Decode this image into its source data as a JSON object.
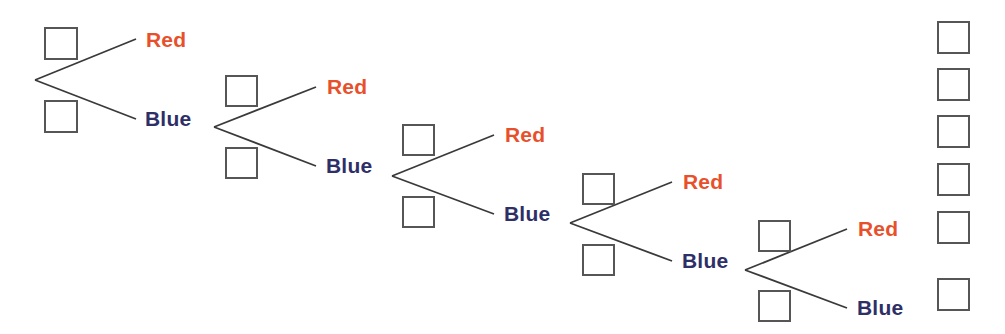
{
  "diagram": {
    "colors": {
      "red_label": "#e8502c",
      "blue_label": "#2f2f68",
      "line": "#3a3a3a",
      "box_border": "#565656",
      "background": "#ffffff"
    },
    "stages": [
      {
        "index": 1,
        "vertex": {
          "x": 35,
          "y": 80
        },
        "boxes": [
          {
            "name": "stage-1-upper-probability-box",
            "x": 44,
            "y": 27,
            "w": 34,
            "h": 33,
            "value": ""
          },
          {
            "name": "stage-1-lower-probability-box",
            "x": 44,
            "y": 100,
            "w": 34,
            "h": 33,
            "value": ""
          }
        ],
        "branches": [
          {
            "outcome": "Red",
            "label": "Red",
            "color": "red",
            "end": {
              "x": 136,
              "y": 39
            },
            "label_x": 146,
            "label_y": 29
          },
          {
            "outcome": "Blue",
            "label": "Blue",
            "color": "blue",
            "end": {
              "x": 136,
              "y": 119
            },
            "label_x": 145,
            "label_y": 108
          }
        ]
      },
      {
        "index": 2,
        "vertex": {
          "x": 214,
          "y": 127
        },
        "boxes": [
          {
            "name": "stage-2-upper-probability-box",
            "x": 225,
            "y": 75,
            "w": 33,
            "h": 32,
            "value": ""
          },
          {
            "name": "stage-2-lower-probability-box",
            "x": 225,
            "y": 147,
            "w": 33,
            "h": 32,
            "value": ""
          }
        ],
        "branches": [
          {
            "outcome": "Red",
            "label": "Red",
            "color": "red",
            "end": {
              "x": 316,
              "y": 87
            },
            "label_x": 327,
            "label_y": 76
          },
          {
            "outcome": "Blue",
            "label": "Blue",
            "color": "blue",
            "end": {
              "x": 316,
              "y": 166
            },
            "label_x": 326,
            "label_y": 155
          }
        ]
      },
      {
        "index": 3,
        "vertex": {
          "x": 392,
          "y": 176
        },
        "boxes": [
          {
            "name": "stage-3-upper-probability-box",
            "x": 402,
            "y": 124,
            "w": 33,
            "h": 32,
            "value": ""
          },
          {
            "name": "stage-3-lower-probability-box",
            "x": 402,
            "y": 196,
            "w": 33,
            "h": 32,
            "value": ""
          }
        ],
        "branches": [
          {
            "outcome": "Red",
            "label": "Red",
            "color": "red",
            "end": {
              "x": 494,
              "y": 135
            },
            "label_x": 505,
            "label_y": 124
          },
          {
            "outcome": "Blue",
            "label": "Blue",
            "color": "blue",
            "end": {
              "x": 494,
              "y": 214
            },
            "label_x": 504,
            "label_y": 203
          }
        ]
      },
      {
        "index": 4,
        "vertex": {
          "x": 570,
          "y": 223
        },
        "boxes": [
          {
            "name": "stage-4-upper-probability-box",
            "x": 582,
            "y": 173,
            "w": 33,
            "h": 32,
            "value": ""
          },
          {
            "name": "stage-4-lower-probability-box",
            "x": 582,
            "y": 244,
            "w": 33,
            "h": 32,
            "value": ""
          }
        ],
        "branches": [
          {
            "outcome": "Red",
            "label": "Red",
            "color": "red",
            "end": {
              "x": 672,
              "y": 182
            },
            "label_x": 683,
            "label_y": 171
          },
          {
            "outcome": "Blue",
            "label": "Blue",
            "color": "blue",
            "end": {
              "x": 672,
              "y": 261
            },
            "label_x": 682,
            "label_y": 250
          }
        ]
      },
      {
        "index": 5,
        "vertex": {
          "x": 745,
          "y": 270
        },
        "boxes": [
          {
            "name": "stage-5-upper-probability-box",
            "x": 758,
            "y": 220,
            "w": 33,
            "h": 32,
            "value": ""
          },
          {
            "name": "stage-5-lower-probability-box",
            "x": 758,
            "y": 290,
            "w": 33,
            "h": 32,
            "value": ""
          }
        ],
        "branches": [
          {
            "outcome": "Red",
            "label": "Red",
            "color": "red",
            "end": {
              "x": 847,
              "y": 229
            },
            "label_x": 858,
            "label_y": 218
          },
          {
            "outcome": "Blue",
            "label": "Blue",
            "color": "blue",
            "end": {
              "x": 847,
              "y": 308
            },
            "label_x": 857,
            "label_y": 297
          }
        ]
      }
    ],
    "outcome_boxes": [
      {
        "name": "outcome-box-1",
        "x": 937,
        "y": 21,
        "w": 33,
        "h": 33,
        "value": ""
      },
      {
        "name": "outcome-box-2",
        "x": 937,
        "y": 68,
        "w": 33,
        "h": 33,
        "value": ""
      },
      {
        "name": "outcome-box-3",
        "x": 937,
        "y": 115,
        "w": 33,
        "h": 33,
        "value": ""
      },
      {
        "name": "outcome-box-4",
        "x": 937,
        "y": 163,
        "w": 33,
        "h": 33,
        "value": ""
      },
      {
        "name": "outcome-box-5",
        "x": 937,
        "y": 211,
        "w": 33,
        "h": 33,
        "value": ""
      },
      {
        "name": "outcome-box-6",
        "x": 937,
        "y": 278,
        "w": 33,
        "h": 33,
        "value": ""
      }
    ]
  }
}
